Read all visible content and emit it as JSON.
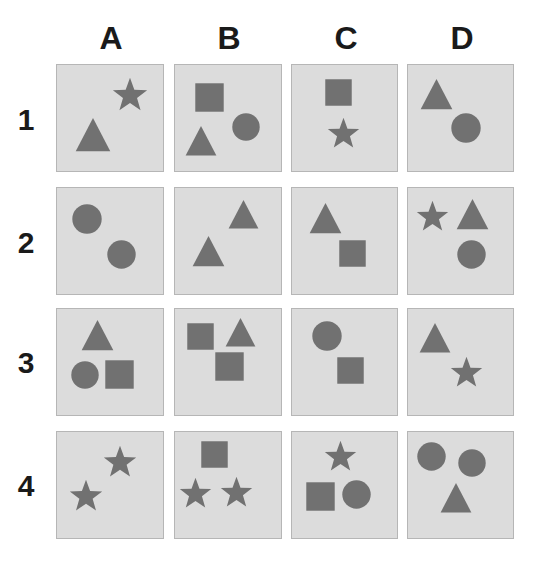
{
  "figure": {
    "background_color": "#ffffff",
    "panel_color": "#dcdcdc",
    "panel_border_color": "#b6b6b6",
    "shape_color": "#717171",
    "label_color": "#1a1a1a"
  },
  "column_labels": [
    "A",
    "B",
    "C",
    "D"
  ],
  "row_labels": [
    "1",
    "2",
    "3",
    "4"
  ],
  "cells": [
    {
      "id": "A1",
      "column": "A",
      "row": "1",
      "shapes": [
        {
          "type": "star",
          "x": 55,
          "y": 12,
          "size": 36
        },
        {
          "type": "triangle",
          "x": 18,
          "y": 52,
          "size": 36
        }
      ]
    },
    {
      "id": "B1",
      "column": "B",
      "row": "1",
      "shapes": [
        {
          "type": "square",
          "x": 20,
          "y": 18,
          "size": 29
        },
        {
          "type": "circle",
          "x": 57,
          "y": 48,
          "size": 28
        },
        {
          "type": "triangle",
          "x": 10,
          "y": 60,
          "size": 32
        }
      ]
    },
    {
      "id": "C1",
      "column": "C",
      "row": "1",
      "shapes": [
        {
          "type": "square",
          "x": 33,
          "y": 14,
          "size": 27
        },
        {
          "type": "star",
          "x": 35,
          "y": 52,
          "size": 33
        }
      ]
    },
    {
      "id": "D1",
      "column": "D",
      "row": "1",
      "shapes": [
        {
          "type": "triangle",
          "x": 12,
          "y": 13,
          "size": 33
        },
        {
          "type": "circle",
          "x": 43,
          "y": 48,
          "size": 30
        }
      ]
    },
    {
      "id": "A2",
      "column": "A",
      "row": "2",
      "shapes": [
        {
          "type": "circle",
          "x": 15,
          "y": 16,
          "size": 30
        },
        {
          "type": "circle",
          "x": 50,
          "y": 52,
          "size": 29
        }
      ]
    },
    {
      "id": "B2",
      "column": "B",
      "row": "2",
      "shapes": [
        {
          "type": "triangle",
          "x": 53,
          "y": 11,
          "size": 31
        },
        {
          "type": "triangle",
          "x": 17,
          "y": 47,
          "size": 33
        }
      ]
    },
    {
      "id": "C2",
      "column": "C",
      "row": "2",
      "shapes": [
        {
          "type": "triangle",
          "x": 17,
          "y": 14,
          "size": 33
        },
        {
          "type": "square",
          "x": 47,
          "y": 52,
          "size": 27
        }
      ]
    },
    {
      "id": "D2",
      "column": "D",
      "row": "2",
      "shapes": [
        {
          "type": "star",
          "x": 8,
          "y": 12,
          "size": 33
        },
        {
          "type": "triangle",
          "x": 48,
          "y": 10,
          "size": 33
        },
        {
          "type": "circle",
          "x": 49,
          "y": 52,
          "size": 29
        }
      ]
    },
    {
      "id": "A3",
      "column": "A",
      "row": "3",
      "shapes": [
        {
          "type": "triangle",
          "x": 24,
          "y": 10,
          "size": 33
        },
        {
          "type": "circle",
          "x": 14,
          "y": 52,
          "size": 28
        },
        {
          "type": "square",
          "x": 48,
          "y": 51,
          "size": 29
        }
      ]
    },
    {
      "id": "B3",
      "column": "B",
      "row": "3",
      "shapes": [
        {
          "type": "square",
          "x": 12,
          "y": 14,
          "size": 27
        },
        {
          "type": "triangle",
          "x": 50,
          "y": 8,
          "size": 31
        },
        {
          "type": "square",
          "x": 40,
          "y": 43,
          "size": 29
        }
      ]
    },
    {
      "id": "C3",
      "column": "C",
      "row": "3",
      "shapes": [
        {
          "type": "circle",
          "x": 20,
          "y": 12,
          "size": 30
        },
        {
          "type": "square",
          "x": 45,
          "y": 48,
          "size": 27
        }
      ]
    },
    {
      "id": "D3",
      "column": "D",
      "row": "3",
      "shapes": [
        {
          "type": "triangle",
          "x": 11,
          "y": 13,
          "size": 32
        },
        {
          "type": "star",
          "x": 42,
          "y": 47,
          "size": 33
        }
      ]
    },
    {
      "id": "A4",
      "column": "A",
      "row": "4",
      "shapes": [
        {
          "type": "star",
          "x": 46,
          "y": 13,
          "size": 34
        },
        {
          "type": "star",
          "x": 12,
          "y": 47,
          "size": 34
        }
      ]
    },
    {
      "id": "B4",
      "column": "B",
      "row": "4",
      "shapes": [
        {
          "type": "square",
          "x": 26,
          "y": 9,
          "size": 27
        },
        {
          "type": "star",
          "x": 4,
          "y": 45,
          "size": 33
        },
        {
          "type": "star",
          "x": 45,
          "y": 44,
          "size": 33
        }
      ]
    },
    {
      "id": "C4",
      "column": "C",
      "row": "4",
      "shapes": [
        {
          "type": "star",
          "x": 32,
          "y": 8,
          "size": 33
        },
        {
          "type": "square",
          "x": 14,
          "y": 50,
          "size": 29
        },
        {
          "type": "circle",
          "x": 50,
          "y": 48,
          "size": 29
        }
      ]
    },
    {
      "id": "D4",
      "column": "D",
      "row": "4",
      "shapes": [
        {
          "type": "circle",
          "x": 9,
          "y": 10,
          "size": 29
        },
        {
          "type": "circle",
          "x": 50,
          "y": 17,
          "size": 28
        },
        {
          "type": "triangle",
          "x": 32,
          "y": 50,
          "size": 32
        }
      ]
    }
  ]
}
